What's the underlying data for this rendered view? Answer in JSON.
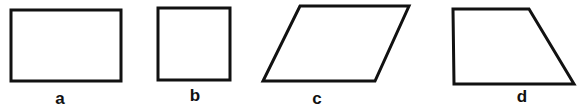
{
  "figure": {
    "stroke_color": "#111111",
    "background": "#ffffff",
    "shapes": [
      {
        "id": "a",
        "label": "a",
        "kind": "rectangle",
        "points": "11,10 121,10 121,81 11,81",
        "label_x": 60,
        "label_y": 104
      },
      {
        "id": "b",
        "label": "b",
        "kind": "square",
        "points": "158,8 230,8 230,80 158,80",
        "label_x": 195,
        "label_y": 101
      },
      {
        "id": "c",
        "label": "c",
        "kind": "parallelogram",
        "points": "300,6 409,6 375,81 263,81",
        "label_x": 317,
        "label_y": 104
      },
      {
        "id": "d",
        "label": "d",
        "kind": "trapezoid",
        "points": "453,9 529,9 574,84 454,84",
        "label_x": 522,
        "label_y": 102
      }
    ]
  }
}
